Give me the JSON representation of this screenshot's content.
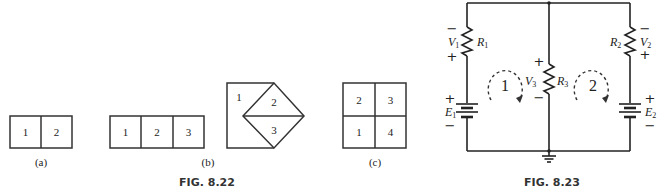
{
  "figure_822": {
    "caption": "FIG. 8.22",
    "part_a": {
      "label": "(a)",
      "cells": [
        "1",
        "2"
      ]
    },
    "part_b": {
      "label": "(b)",
      "row_cells": [
        "1",
        "2",
        "3"
      ],
      "diamond_cells": [
        "1",
        "2",
        "3"
      ]
    },
    "part_c": {
      "label": "(c)",
      "cells": [
        "2",
        "3",
        "1",
        "4"
      ]
    }
  },
  "figure_823": {
    "caption": "FIG. 8.23",
    "elements": {
      "v1": "V",
      "v1_sub": "1",
      "r1": "R",
      "r1_sub": "1",
      "v2": "V",
      "v2_sub": "2",
      "r2": "R",
      "r2_sub": "2",
      "v3": "V",
      "v3_sub": "3",
      "r3": "R",
      "r3_sub": "3",
      "e1": "E",
      "e1_sub": "1",
      "e2": "E",
      "e2_sub": "2"
    },
    "loops": [
      "1",
      "2"
    ],
    "signs": {
      "plus": "+",
      "minus": "−"
    }
  }
}
